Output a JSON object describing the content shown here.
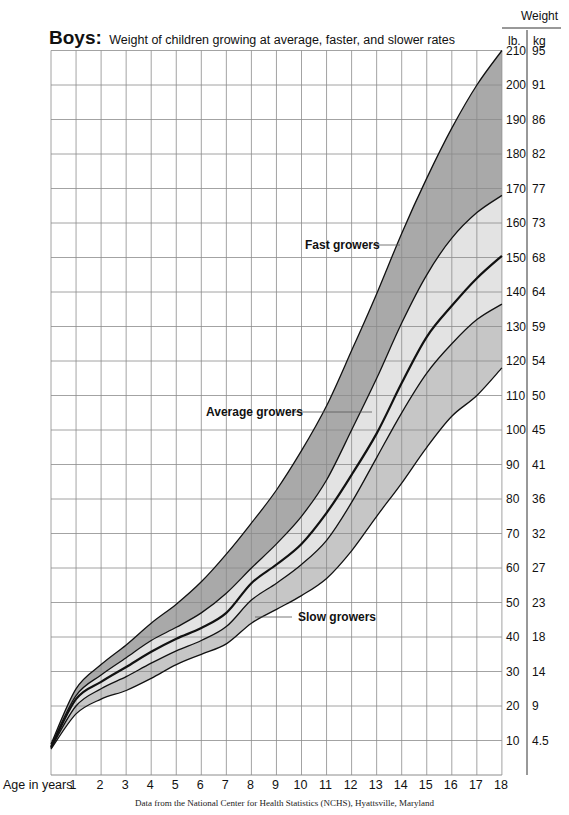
{
  "title": {
    "bold": "Boys:",
    "subtitle": "Weight of children growing at average, faster, and slower rates"
  },
  "axis": {
    "weight_header": "Weight",
    "unit_lb": "lb.",
    "unit_kg": "kg",
    "x_label": "Age in years",
    "x_ticks": [
      "1",
      "2",
      "3",
      "4",
      "5",
      "6",
      "7",
      "8",
      "9",
      "10",
      "11",
      "12",
      "13",
      "14",
      "15",
      "16",
      "17",
      "18"
    ],
    "lb_ticks": [
      "210",
      "200",
      "190",
      "180",
      "170",
      "160",
      "150",
      "140",
      "130",
      "120",
      "110",
      "100",
      "90",
      "80",
      "70",
      "60",
      "50",
      "40",
      "30",
      "20",
      "10"
    ],
    "kg_ticks": [
      "95",
      "91",
      "86",
      "82",
      "77",
      "73",
      "68",
      "64",
      "59",
      "54",
      "50",
      "45",
      "41",
      "36",
      "32",
      "27",
      "23",
      "18",
      "14",
      "9",
      "4.5"
    ]
  },
  "annotations": {
    "fast": "Fast growers",
    "average": "Average growers",
    "slow": "Slow growers"
  },
  "source": "Data from the National Center for Health Statistics (NCHS), Hyattsville, Maryland",
  "colors": {
    "band_fast": "#a9a9a9",
    "band_average": "#e3e3e3",
    "band_slow": "#c6c6c6",
    "grid": "#8c8c8c",
    "curve": "#111111"
  },
  "chart_data": {
    "type": "area",
    "title": "Boys: Weight of children growing at average, faster, and slower rates",
    "xlabel": "Age in years",
    "ylabel": "Weight (lb. / kg)",
    "x": [
      0,
      1,
      2,
      3,
      4,
      5,
      6,
      7,
      8,
      9,
      10,
      11,
      12,
      13,
      14,
      15,
      16,
      17,
      18
    ],
    "xlim": [
      0,
      18
    ],
    "ylim": [
      0,
      210
    ],
    "grid": true,
    "series": [
      {
        "name": "Upper curve (fast growers)",
        "values": [
          9,
          25,
          32,
          37.7,
          44,
          49.5,
          56,
          64,
          73,
          82.6,
          94,
          107,
          123,
          139.5,
          157,
          173,
          187.5,
          200,
          210
        ]
      },
      {
        "name": "Upper-average curve",
        "values": [
          8.5,
          23,
          29,
          34,
          39,
          42.8,
          47,
          52.7,
          60,
          67,
          75,
          85.5,
          100,
          115,
          131,
          145,
          155.6,
          163,
          168
        ]
      },
      {
        "name": "Average curve (median, bold)",
        "values": [
          8,
          22,
          27,
          31.3,
          35.7,
          39.5,
          42.6,
          47,
          55.6,
          61,
          67,
          76,
          87,
          99,
          113.6,
          127,
          136,
          144,
          150.5
        ]
      },
      {
        "name": "Lower-average curve",
        "values": [
          7.8,
          20,
          25,
          28.5,
          32.4,
          36,
          39,
          43,
          50.7,
          55.6,
          61,
          68,
          79,
          92,
          105,
          116.5,
          125,
          132,
          136.5
        ]
      },
      {
        "name": "Lower curve (slow growers)",
        "values": [
          7.5,
          17.7,
          22,
          24.5,
          28,
          32,
          35,
          38,
          44,
          48,
          52,
          57,
          65,
          75,
          84.6,
          95,
          104,
          110,
          118
        ]
      }
    ],
    "bands": [
      {
        "name": "Fast growers",
        "between": [
          "Upper curve (fast growers)",
          "Upper-average curve"
        ],
        "shade": "dark"
      },
      {
        "name": "Average growers",
        "between": [
          "Upper-average curve",
          "Lower-average curve"
        ],
        "shade": "light"
      },
      {
        "name": "Slow growers",
        "between": [
          "Lower-average curve",
          "Lower curve (slow growers)"
        ],
        "shade": "medium"
      }
    ],
    "secondary_axis": {
      "unit": "kg",
      "ticks_lb_to_kg": {
        "210": 95,
        "200": 91,
        "190": 86,
        "180": 82,
        "170": 77,
        "160": 73,
        "150": 68,
        "140": 64,
        "130": 59,
        "120": 54,
        "110": 50,
        "100": 45,
        "90": 41,
        "80": 36,
        "70": 32,
        "60": 27,
        "50": 23,
        "40": 18,
        "30": 14,
        "20": 9,
        "10": 4.5
      }
    },
    "annotations": [
      "Fast growers",
      "Average growers",
      "Slow growers"
    ],
    "source": "Data from the National Center for Health Statistics (NCHS), Hyattsville, Maryland"
  }
}
